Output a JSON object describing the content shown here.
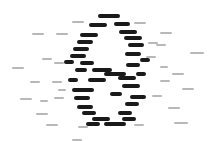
{
  "graph": {
    "type": "network-graph",
    "labels_legible": false,
    "nodes": [
      {
        "id": 1,
        "label": null,
        "weight": 2
      },
      {
        "id": 2,
        "label": null,
        "weight": 2
      },
      {
        "id": 3,
        "label": null,
        "weight": 2
      },
      {
        "id": 4,
        "label": null,
        "weight": 2
      },
      {
        "id": 5,
        "label": null,
        "weight": 2
      },
      {
        "id": 6,
        "label": null,
        "weight": 2
      },
      {
        "id": 7,
        "label": null,
        "weight": 2
      },
      {
        "id": 8,
        "label": null,
        "weight": 2
      },
      {
        "id": 9,
        "label": null,
        "weight": 2
      },
      {
        "id": 10,
        "label": null,
        "weight": 2
      },
      {
        "id": 11,
        "label": null,
        "weight": 2
      },
      {
        "id": 12,
        "label": null,
        "weight": 2
      },
      {
        "id": 13,
        "label": null,
        "weight": 2
      },
      {
        "id": 14,
        "label": null,
        "weight": 2
      },
      {
        "id": 15,
        "label": null,
        "weight": 2
      },
      {
        "id": 16,
        "label": null,
        "weight": 2
      },
      {
        "id": 17,
        "label": null,
        "weight": 2
      },
      {
        "id": 18,
        "label": null,
        "weight": 2
      },
      {
        "id": 19,
        "label": null,
        "weight": 2
      },
      {
        "id": 20,
        "label": null,
        "weight": 2
      },
      {
        "id": 21,
        "label": null,
        "weight": 2
      },
      {
        "id": 22,
        "label": null,
        "weight": 2
      },
      {
        "id": 23,
        "label": null,
        "weight": 2
      },
      {
        "id": 24,
        "label": null,
        "weight": 2
      },
      {
        "id": 25,
        "label": null,
        "weight": 2
      },
      {
        "id": 26,
        "label": null,
        "weight": 2
      },
      {
        "id": 27,
        "label": null,
        "weight": 2
      },
      {
        "id": 28,
        "label": null,
        "weight": 2
      },
      {
        "id": 29,
        "label": null,
        "weight": 2
      },
      {
        "id": 30,
        "label": null,
        "weight": 2
      },
      {
        "id": 31,
        "label": null,
        "weight": 2
      },
      {
        "id": 32,
        "label": null,
        "weight": 2
      },
      {
        "id": 33,
        "label": null,
        "weight": 2
      },
      {
        "id": 34,
        "label": null,
        "weight": 2
      },
      {
        "id": 35,
        "label": null,
        "weight": 2
      },
      {
        "id": 36,
        "label": null,
        "weight": 2
      },
      {
        "id": 37,
        "label": null,
        "weight": 1
      },
      {
        "id": 38,
        "label": null,
        "weight": 1
      },
      {
        "id": 39,
        "label": null,
        "weight": 1
      },
      {
        "id": 40,
        "label": null,
        "weight": 1
      },
      {
        "id": 41,
        "label": null,
        "weight": 1
      },
      {
        "id": 42,
        "label": null,
        "weight": 1
      },
      {
        "id": 43,
        "label": null,
        "weight": 1
      },
      {
        "id": 44,
        "label": null,
        "weight": 1
      },
      {
        "id": 45,
        "label": null,
        "weight": 1
      },
      {
        "id": 46,
        "label": null,
        "weight": 1
      },
      {
        "id": 47,
        "label": null,
        "weight": 1
      },
      {
        "id": 48,
        "label": null,
        "weight": 1
      },
      {
        "id": 49,
        "label": null,
        "weight": 1
      },
      {
        "id": 50,
        "label": null,
        "weight": 1
      },
      {
        "id": 51,
        "label": null,
        "weight": 1
      },
      {
        "id": 52,
        "label": null,
        "weight": 1
      },
      {
        "id": 53,
        "label": null,
        "weight": 1
      },
      {
        "id": 54,
        "label": null,
        "weight": 1
      },
      {
        "id": 55,
        "label": null,
        "weight": 1
      },
      {
        "id": 56,
        "label": null,
        "weight": 1
      },
      {
        "id": 57,
        "label": null,
        "weight": 1
      },
      {
        "id": 58,
        "label": null,
        "weight": 1
      },
      {
        "id": 59,
        "label": null,
        "weight": 1
      },
      {
        "id": 60,
        "label": null,
        "weight": 1
      },
      {
        "id": 61,
        "label": null,
        "weight": 1
      },
      {
        "id": 62,
        "label": null,
        "weight": 1
      },
      {
        "id": 63,
        "label": null,
        "weight": 1
      },
      {
        "id": 64,
        "label": null,
        "weight": 1
      },
      {
        "id": 65,
        "label": null,
        "weight": 1
      },
      {
        "id": 66,
        "label": null,
        "weight": 1
      }
    ]
  }
}
